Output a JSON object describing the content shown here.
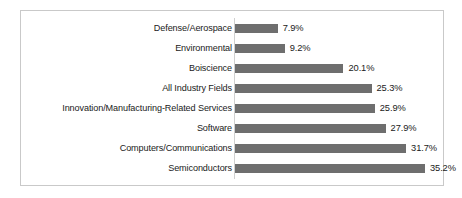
{
  "chart_data": {
    "type": "bar",
    "orientation": "horizontal",
    "title": "",
    "subtitle": "",
    "xlabel": "",
    "ylabel": "",
    "grid": false,
    "legend": false,
    "legend_position": "none",
    "value_suffix": "%",
    "xlim": [
      0,
      35.2
    ],
    "axis_line": "vertical-at-zero",
    "bar_color": "#6e6e6e",
    "border_color": "#c9c9c9",
    "text_color": "#1a1a1a",
    "categories": [
      "Defense/Aerospace",
      "Environmental",
      "Boiscience",
      "All Industry Fields",
      "Innovation/Manufacturing-Related Services",
      "Software",
      "Computers/Communications",
      "Semiconductors"
    ],
    "values": [
      7.9,
      9.2,
      20.1,
      25.3,
      25.9,
      27.9,
      31.7,
      35.2
    ],
    "value_labels": [
      "7.9%",
      "9.2%",
      "20.1%",
      "25.3%",
      "25.9%",
      "27.9%",
      "31.7%",
      "35.2%"
    ]
  }
}
